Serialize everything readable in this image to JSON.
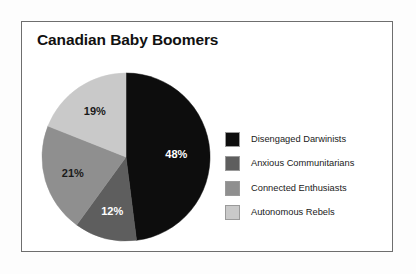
{
  "frame": {
    "background": "#ffffff",
    "border_color": "#6e6e6e"
  },
  "title": "Canadian Baby Boomers",
  "chart_data": {
    "type": "pie",
    "title": "Canadian Baby Boomers",
    "xlabel": "",
    "ylabel": "",
    "legend_position": "right",
    "grid": false,
    "start_angle_deg": 0,
    "direction": "clockwise",
    "categories": [
      "Disengaged Darwinists",
      "Anxious Communitarians",
      "Connected Enthusiasts",
      "Autonomous Rebels"
    ],
    "values": [
      48,
      12,
      21,
      19
    ],
    "value_labels": [
      "48%",
      "12%",
      "21%",
      "19%"
    ],
    "colors": [
      "#0d0d0d",
      "#5e5e5e",
      "#8f8f8f",
      "#c9c9c9"
    ],
    "label_text_colors": [
      "#ffffff",
      "#ffffff",
      "#1a1a1a",
      "#1a1a1a"
    ],
    "units": "percent",
    "total": 100
  },
  "legend": {
    "items": [
      {
        "label": "Disengaged Darwinists",
        "color": "#0d0d0d"
      },
      {
        "label": "Anxious Communitarians",
        "color": "#5e5e5e"
      },
      {
        "label": "Connected Enthusiasts",
        "color": "#8f8f8f"
      },
      {
        "label": "Autonomous Rebels",
        "color": "#c9c9c9"
      }
    ]
  }
}
